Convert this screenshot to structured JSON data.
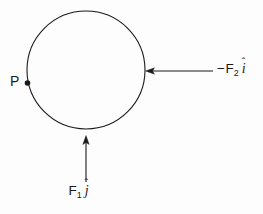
{
  "figure": {
    "type": "free-body-force-diagram",
    "background_color": "#fdfdfd",
    "stroke_color": "#1a1a1a",
    "body": {
      "shape": "circle",
      "center_x": 86,
      "center_y": 70,
      "radius": 59,
      "fill": "none"
    },
    "point": {
      "name": "P",
      "label": "P",
      "x": 27,
      "y": 83,
      "marker": "filled-dot"
    },
    "forces": [
      {
        "name": "F2",
        "label_minus": "−",
        "label_base": "F",
        "label_subscript": "2",
        "label_unit_vector": "i",
        "label_hat": "ˆ",
        "label_full": "−F₂ î",
        "direction": "leftward",
        "tail_x": 213,
        "tip_x": 147,
        "y": 71
      },
      {
        "name": "F1",
        "label_minus": "",
        "label_base": "F",
        "label_subscript": "1",
        "label_unit_vector": "j",
        "label_hat": "ˆ",
        "label_full": "F₁ ĵ",
        "direction": "upward",
        "tail_y": 182,
        "tip_y": 136,
        "x": 86
      }
    ]
  }
}
